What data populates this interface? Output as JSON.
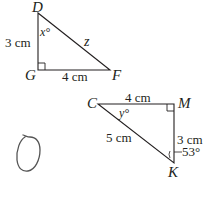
{
  "triangle_dgf": {
    "vertices": {
      "D": "D",
      "G": "G",
      "F": "F"
    },
    "side_dg": "3 cm",
    "side_gf": "4 cm",
    "hypotenuse": "z",
    "angle_d": "x°",
    "right_angle_at": "G"
  },
  "triangle_cmk": {
    "vertices": {
      "C": "C",
      "M": "M",
      "K": "K"
    },
    "side_cm": "4 cm",
    "side_mk": "3 cm",
    "hypotenuse_ck": "5 cm",
    "angle_c": "y°",
    "angle_k": "53°",
    "right_angle_at": "M"
  },
  "annotation": {
    "shape": "hand-drawn loop"
  },
  "colors": {
    "line": "#231f20",
    "pencil": "#555555"
  }
}
